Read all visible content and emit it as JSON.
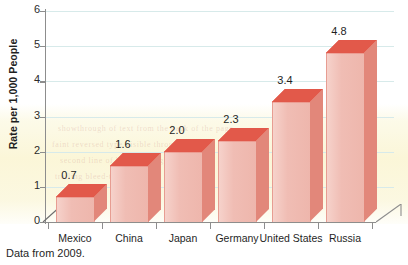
{
  "chart_data": {
    "type": "bar",
    "title": "",
    "subtitle": "",
    "xlabel": "",
    "ylabel": "Rate per 1,000 People",
    "categories": [
      "Mexico",
      "China",
      "Japan",
      "Germany",
      "United States",
      "Russia"
    ],
    "values": [
      0.7,
      1.6,
      2.0,
      2.3,
      3.4,
      4.8
    ],
    "value_labels": [
      "0.7",
      "1.6",
      "2.0",
      "2.3",
      "3.4",
      "4.8"
    ],
    "ylim": [
      0,
      6
    ],
    "ytick_values": [
      0,
      1,
      2,
      3,
      4,
      5,
      6
    ],
    "ytick_labels": [
      "0",
      "1",
      "2",
      "3",
      "4",
      "5",
      "6"
    ],
    "grid": true,
    "grid_axis": "y",
    "legend": false,
    "legend_position": "none",
    "style": "3d-column",
    "series": [
      {
        "name": "Rate per 1,000 People",
        "values": [
          0.7,
          1.6,
          2.0,
          2.3,
          3.4,
          4.8
        ]
      }
    ]
  },
  "caption": {
    "text": "Data from 2009."
  },
  "colors": {
    "bar_front": "#f0bdb4",
    "bar_top": "#e2594a",
    "bar_side": "#e2877a",
    "gridline": "#d7eaea",
    "axis": "#8d8d8d",
    "text": "#1f1f1f",
    "page_background": "#ffffff",
    "scan_tint": "#faf4ce"
  },
  "scan_artifacts": {
    "ghost_lines": [
      "showthrough of text from the back of the page",
      "faint reversed type visible through paper",
      "second line of bleed-through text",
      "trailing bleed-through line"
    ]
  }
}
